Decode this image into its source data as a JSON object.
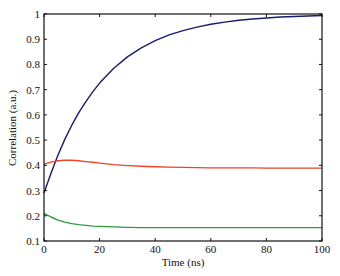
{
  "chart_data": {
    "type": "line",
    "title": "",
    "xlabel": "Time (ns)",
    "ylabel": "Correlation (a.u.)",
    "xlim": [
      0,
      100
    ],
    "ylim": [
      0.1,
      1.0
    ],
    "xticks": [
      0,
      20,
      40,
      60,
      80,
      100
    ],
    "xtick_labels": [
      "0",
      "20",
      "40",
      "60",
      "80",
      "100"
    ],
    "yticks": [
      0.1,
      0.2,
      0.3,
      0.4,
      0.5,
      0.6,
      0.7,
      0.8,
      0.9,
      1.0
    ],
    "ytick_labels": [
      "0.1",
      "0.2",
      "0.3",
      "0.4",
      "0.5",
      "0.6",
      "0.7",
      "0.8",
      "0.9",
      "1"
    ],
    "grid": false,
    "legend": null,
    "x": [
      0,
      2.5,
      5,
      7.5,
      10,
      12.5,
      15,
      17.5,
      20,
      25,
      30,
      35,
      40,
      45,
      50,
      55,
      60,
      65,
      70,
      75,
      80,
      85,
      90,
      95,
      100
    ],
    "series": [
      {
        "name": "blue",
        "color": "#1a1a6e",
        "values": [
          0.29,
          0.369,
          0.44,
          0.503,
          0.559,
          0.609,
          0.652,
          0.691,
          0.726,
          0.784,
          0.83,
          0.866,
          0.894,
          0.917,
          0.934,
          0.948,
          0.959,
          0.968,
          0.975,
          0.98,
          0.984,
          0.988,
          0.99,
          0.992,
          0.994
        ]
      },
      {
        "name": "red",
        "color": "#e8452a",
        "values": [
          0.405,
          0.413,
          0.418,
          0.42,
          0.42,
          0.418,
          0.415,
          0.412,
          0.409,
          0.403,
          0.399,
          0.396,
          0.394,
          0.393,
          0.392,
          0.391,
          0.39,
          0.39,
          0.39,
          0.39,
          0.389,
          0.389,
          0.389,
          0.389,
          0.389
        ]
      },
      {
        "name": "green",
        "color": "#2e9a3e",
        "values": [
          0.21,
          0.195,
          0.183,
          0.175,
          0.169,
          0.165,
          0.162,
          0.159,
          0.158,
          0.156,
          0.154,
          0.153,
          0.153,
          0.153,
          0.153,
          0.153,
          0.153,
          0.153,
          0.153,
          0.153,
          0.153,
          0.153,
          0.153,
          0.153,
          0.153
        ]
      }
    ]
  }
}
